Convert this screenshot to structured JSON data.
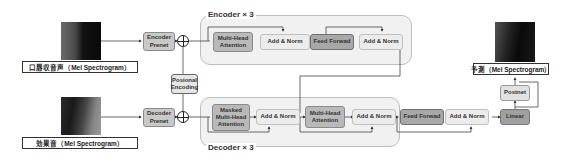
{
  "inputs": {
    "encoder_input_label": "口唇収音声（Mel Spectrogram）",
    "decoder_input_label": "効果音（Mel Spectrogram）",
    "output_label": "予測（Mel Spectrogram）"
  },
  "encoder": {
    "title": "Encoder × 3",
    "prenet": "Encoder Prenet",
    "blocks": [
      "Multi-Head Attention",
      "Add & Norm",
      "Feed Forwad",
      "Add & Norm"
    ]
  },
  "positional_encoding": "Posional Encoding",
  "decoder": {
    "title": "Decoder × 3",
    "prenet": "Decoder Prenet",
    "blocks": [
      "Masked Multi-Head Attention",
      "Add & Norm",
      "Multi-Head Attention",
      "Add & Norm",
      "Feed Forwad",
      "Add & Norm"
    ]
  },
  "linear": "Linear",
  "postnet": "Postnet"
}
